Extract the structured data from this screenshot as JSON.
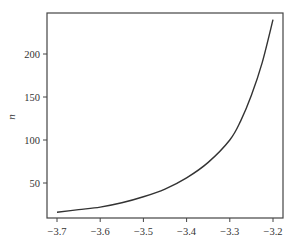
{
  "chart_data": {
    "type": "line",
    "title": "",
    "xlabel": "",
    "ylabel": "n",
    "xlim": [
      -3.725,
      -3.175
    ],
    "ylim": [
      9,
      247
    ],
    "grid": false,
    "legend": null,
    "x_ticks": [
      -3.7,
      -3.6,
      -3.5,
      -3.4,
      -3.3,
      -3.2
    ],
    "x_tick_labels": [
      "−3.7",
      "−3.6",
      "−3.5",
      "−3.4",
      "−3.3",
      "−3.2"
    ],
    "y_ticks": [
      50,
      100,
      150,
      200
    ],
    "y_tick_labels": [
      "50",
      "100",
      "150",
      "200"
    ],
    "series": [
      {
        "name": "n",
        "color": "#333333",
        "x": [
          -3.7,
          -3.65,
          -3.6,
          -3.55,
          -3.5,
          -3.45,
          -3.4,
          -3.35,
          -3.3,
          -3.275,
          -3.25,
          -3.225,
          -3.2
        ],
        "y": [
          16,
          19,
          22,
          27,
          34,
          43,
          56,
          74,
          100,
          122,
          152,
          190,
          240
        ]
      }
    ]
  }
}
